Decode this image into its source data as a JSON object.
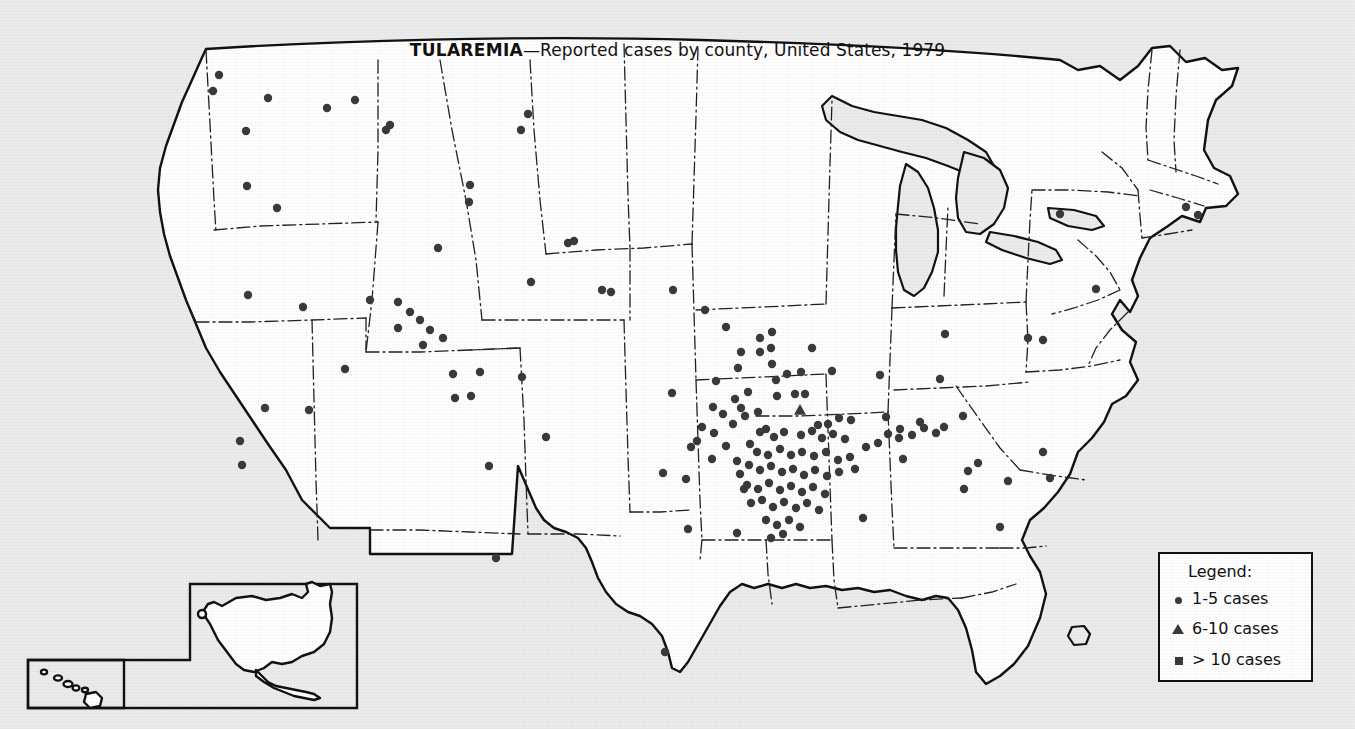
{
  "title": {
    "disease": "TULAREMIA",
    "rest": "—Reported cases by county, United States, 1979",
    "full": "TULAREMIA—Reported cases by county, United States, 1979"
  },
  "legend": {
    "heading": "Legend:",
    "items": [
      {
        "symbol": "circle",
        "label": "1-5 cases"
      },
      {
        "symbol": "triangle",
        "label": "6-10 cases"
      },
      {
        "symbol": "square",
        "label": "> 10 cases"
      }
    ]
  },
  "insets": [
    {
      "name": "alaska-inset",
      "label": ""
    },
    {
      "name": "hawaii-inset",
      "label": ""
    }
  ],
  "colors": {
    "page_background": "#ececec",
    "land_fill": "#ffffff",
    "water_fill": "#ececec",
    "outline": "#111111",
    "state_border": "#222222",
    "marker": "#3a3a3a",
    "legend_background": "#ffffff",
    "legend_border": "#111111"
  },
  "chart_data": {
    "type": "map",
    "title": "TULAREMIA—Reported cases by county, United States, 1979",
    "projection": "contiguous-united-states-with-alaska-hawaii-insets",
    "marker_classes": [
      {
        "symbol": "circle",
        "meaning": "1-5 cases",
        "count_rendered": 170
      },
      {
        "symbol": "triangle",
        "meaning": "6-10 cases",
        "count_rendered": 1
      },
      {
        "symbol": "square",
        "meaning": "> 10 cases",
        "count_rendered": 0
      }
    ],
    "markers": [
      {
        "x": 219,
        "y": 75,
        "s": "c"
      },
      {
        "x": 268,
        "y": 98,
        "s": "c"
      },
      {
        "x": 327,
        "y": 108,
        "s": "c"
      },
      {
        "x": 390,
        "y": 125,
        "s": "c"
      },
      {
        "x": 528,
        "y": 114,
        "s": "c"
      },
      {
        "x": 213,
        "y": 91,
        "s": "c"
      },
      {
        "x": 246,
        "y": 131,
        "s": "c"
      },
      {
        "x": 355,
        "y": 100,
        "s": "c"
      },
      {
        "x": 386,
        "y": 130,
        "s": "c"
      },
      {
        "x": 247,
        "y": 186,
        "s": "c"
      },
      {
        "x": 277,
        "y": 208,
        "s": "c"
      },
      {
        "x": 470,
        "y": 185,
        "s": "c"
      },
      {
        "x": 469,
        "y": 202,
        "s": "c"
      },
      {
        "x": 574,
        "y": 241,
        "s": "c"
      },
      {
        "x": 438,
        "y": 248,
        "s": "c"
      },
      {
        "x": 248,
        "y": 295,
        "s": "c"
      },
      {
        "x": 303,
        "y": 307,
        "s": "c"
      },
      {
        "x": 240,
        "y": 441,
        "s": "c"
      },
      {
        "x": 242,
        "y": 465,
        "s": "c"
      },
      {
        "x": 265,
        "y": 408,
        "s": "c"
      },
      {
        "x": 309,
        "y": 410,
        "s": "c"
      },
      {
        "x": 345,
        "y": 369,
        "s": "c"
      },
      {
        "x": 370,
        "y": 300,
        "s": "c"
      },
      {
        "x": 398,
        "y": 302,
        "s": "c"
      },
      {
        "x": 410,
        "y": 312,
        "s": "c"
      },
      {
        "x": 420,
        "y": 320,
        "s": "c"
      },
      {
        "x": 430,
        "y": 330,
        "s": "c"
      },
      {
        "x": 398,
        "y": 328,
        "s": "c"
      },
      {
        "x": 423,
        "y": 345,
        "s": "c"
      },
      {
        "x": 443,
        "y": 338,
        "s": "c"
      },
      {
        "x": 453,
        "y": 374,
        "s": "c"
      },
      {
        "x": 480,
        "y": 372,
        "s": "c"
      },
      {
        "x": 522,
        "y": 377,
        "s": "c"
      },
      {
        "x": 455,
        "y": 398,
        "s": "c"
      },
      {
        "x": 471,
        "y": 396,
        "s": "c"
      },
      {
        "x": 489,
        "y": 466,
        "s": "c"
      },
      {
        "x": 546,
        "y": 437,
        "s": "c"
      },
      {
        "x": 496,
        "y": 558,
        "s": "c"
      },
      {
        "x": 521,
        "y": 130,
        "s": "c"
      },
      {
        "x": 531,
        "y": 282,
        "s": "c"
      },
      {
        "x": 673,
        "y": 290,
        "s": "c"
      },
      {
        "x": 568,
        "y": 243,
        "s": "c"
      },
      {
        "x": 602,
        "y": 290,
        "s": "c"
      },
      {
        "x": 611,
        "y": 292,
        "s": "c"
      },
      {
        "x": 663,
        "y": 473,
        "s": "c"
      },
      {
        "x": 665,
        "y": 652,
        "s": "c"
      },
      {
        "x": 688,
        "y": 529,
        "s": "c"
      },
      {
        "x": 737,
        "y": 533,
        "s": "c"
      },
      {
        "x": 697,
        "y": 441,
        "s": "c"
      },
      {
        "x": 714,
        "y": 433,
        "s": "c"
      },
      {
        "x": 726,
        "y": 446,
        "s": "c"
      },
      {
        "x": 733,
        "y": 424,
        "s": "c"
      },
      {
        "x": 737,
        "y": 461,
        "s": "c"
      },
      {
        "x": 740,
        "y": 474,
        "s": "c"
      },
      {
        "x": 744,
        "y": 489,
        "s": "c"
      },
      {
        "x": 750,
        "y": 444,
        "s": "c"
      },
      {
        "x": 745,
        "y": 416,
        "s": "c"
      },
      {
        "x": 760,
        "y": 352,
        "s": "c"
      },
      {
        "x": 771,
        "y": 348,
        "s": "c"
      },
      {
        "x": 772,
        "y": 364,
        "s": "c"
      },
      {
        "x": 776,
        "y": 380,
        "s": "c"
      },
      {
        "x": 787,
        "y": 374,
        "s": "c"
      },
      {
        "x": 801,
        "y": 372,
        "s": "c"
      },
      {
        "x": 812,
        "y": 348,
        "s": "c"
      },
      {
        "x": 832,
        "y": 371,
        "s": "c"
      },
      {
        "x": 777,
        "y": 396,
        "s": "c"
      },
      {
        "x": 795,
        "y": 394,
        "s": "c"
      },
      {
        "x": 805,
        "y": 394,
        "s": "c"
      },
      {
        "x": 800,
        "y": 410,
        "s": "t"
      },
      {
        "x": 758,
        "y": 412,
        "s": "c"
      },
      {
        "x": 741,
        "y": 408,
        "s": "c"
      },
      {
        "x": 760,
        "y": 432,
        "s": "c"
      },
      {
        "x": 766,
        "y": 429,
        "s": "c"
      },
      {
        "x": 774,
        "y": 437,
        "s": "c"
      },
      {
        "x": 784,
        "y": 432,
        "s": "c"
      },
      {
        "x": 801,
        "y": 435,
        "s": "c"
      },
      {
        "x": 812,
        "y": 431,
        "s": "c"
      },
      {
        "x": 822,
        "y": 438,
        "s": "c"
      },
      {
        "x": 833,
        "y": 434,
        "s": "c"
      },
      {
        "x": 845,
        "y": 439,
        "s": "c"
      },
      {
        "x": 818,
        "y": 425,
        "s": "c"
      },
      {
        "x": 828,
        "y": 424,
        "s": "c"
      },
      {
        "x": 839,
        "y": 418,
        "s": "c"
      },
      {
        "x": 851,
        "y": 420,
        "s": "c"
      },
      {
        "x": 757,
        "y": 452,
        "s": "c"
      },
      {
        "x": 768,
        "y": 455,
        "s": "c"
      },
      {
        "x": 780,
        "y": 449,
        "s": "c"
      },
      {
        "x": 791,
        "y": 455,
        "s": "c"
      },
      {
        "x": 802,
        "y": 452,
        "s": "c"
      },
      {
        "x": 814,
        "y": 456,
        "s": "c"
      },
      {
        "x": 826,
        "y": 452,
        "s": "c"
      },
      {
        "x": 838,
        "y": 460,
        "s": "c"
      },
      {
        "x": 850,
        "y": 457,
        "s": "c"
      },
      {
        "x": 749,
        "y": 465,
        "s": "c"
      },
      {
        "x": 760,
        "y": 470,
        "s": "c"
      },
      {
        "x": 771,
        "y": 466,
        "s": "c"
      },
      {
        "x": 782,
        "y": 472,
        "s": "c"
      },
      {
        "x": 793,
        "y": 469,
        "s": "c"
      },
      {
        "x": 804,
        "y": 475,
        "s": "c"
      },
      {
        "x": 815,
        "y": 470,
        "s": "c"
      },
      {
        "x": 827,
        "y": 476,
        "s": "c"
      },
      {
        "x": 839,
        "y": 472,
        "s": "c"
      },
      {
        "x": 855,
        "y": 469,
        "s": "c"
      },
      {
        "x": 747,
        "y": 485,
        "s": "c"
      },
      {
        "x": 758,
        "y": 489,
        "s": "c"
      },
      {
        "x": 769,
        "y": 483,
        "s": "c"
      },
      {
        "x": 780,
        "y": 490,
        "s": "c"
      },
      {
        "x": 791,
        "y": 486,
        "s": "c"
      },
      {
        "x": 802,
        "y": 492,
        "s": "c"
      },
      {
        "x": 813,
        "y": 487,
        "s": "c"
      },
      {
        "x": 825,
        "y": 494,
        "s": "c"
      },
      {
        "x": 751,
        "y": 503,
        "s": "c"
      },
      {
        "x": 762,
        "y": 500,
        "s": "c"
      },
      {
        "x": 773,
        "y": 507,
        "s": "c"
      },
      {
        "x": 784,
        "y": 502,
        "s": "c"
      },
      {
        "x": 796,
        "y": 508,
        "s": "c"
      },
      {
        "x": 807,
        "y": 503,
        "s": "c"
      },
      {
        "x": 819,
        "y": 510,
        "s": "c"
      },
      {
        "x": 766,
        "y": 520,
        "s": "c"
      },
      {
        "x": 777,
        "y": 525,
        "s": "c"
      },
      {
        "x": 789,
        "y": 520,
        "s": "c"
      },
      {
        "x": 800,
        "y": 527,
        "s": "c"
      },
      {
        "x": 771,
        "y": 538,
        "s": "c"
      },
      {
        "x": 783,
        "y": 534,
        "s": "c"
      },
      {
        "x": 863,
        "y": 518,
        "s": "c"
      },
      {
        "x": 866,
        "y": 447,
        "s": "c"
      },
      {
        "x": 878,
        "y": 443,
        "s": "c"
      },
      {
        "x": 888,
        "y": 434,
        "s": "c"
      },
      {
        "x": 900,
        "y": 429,
        "s": "c"
      },
      {
        "x": 912,
        "y": 435,
        "s": "c"
      },
      {
        "x": 924,
        "y": 428,
        "s": "c"
      },
      {
        "x": 936,
        "y": 433,
        "s": "c"
      },
      {
        "x": 944,
        "y": 427,
        "s": "c"
      },
      {
        "x": 968,
        "y": 471,
        "s": "c"
      },
      {
        "x": 978,
        "y": 463,
        "s": "c"
      },
      {
        "x": 964,
        "y": 489,
        "s": "c"
      },
      {
        "x": 1008,
        "y": 481,
        "s": "c"
      },
      {
        "x": 1043,
        "y": 452,
        "s": "c"
      },
      {
        "x": 1050,
        "y": 478,
        "s": "c"
      },
      {
        "x": 1028,
        "y": 338,
        "s": "c"
      },
      {
        "x": 1060,
        "y": 214,
        "s": "c"
      },
      {
        "x": 1186,
        "y": 207,
        "s": "c"
      },
      {
        "x": 1198,
        "y": 215,
        "s": "c"
      },
      {
        "x": 1096,
        "y": 289,
        "s": "c"
      },
      {
        "x": 945,
        "y": 334,
        "s": "c"
      },
      {
        "x": 880,
        "y": 375,
        "s": "c"
      },
      {
        "x": 940,
        "y": 379,
        "s": "c"
      },
      {
        "x": 1043,
        "y": 340,
        "s": "c"
      },
      {
        "x": 963,
        "y": 416,
        "s": "c"
      },
      {
        "x": 920,
        "y": 422,
        "s": "c"
      },
      {
        "x": 886,
        "y": 417,
        "s": "c"
      },
      {
        "x": 903,
        "y": 459,
        "s": "c"
      },
      {
        "x": 899,
        "y": 438,
        "s": "c"
      },
      {
        "x": 1000,
        "y": 527,
        "s": "c"
      },
      {
        "x": 716,
        "y": 381,
        "s": "c"
      },
      {
        "x": 738,
        "y": 368,
        "s": "c"
      },
      {
        "x": 672,
        "y": 393,
        "s": "c"
      },
      {
        "x": 712,
        "y": 459,
        "s": "c"
      },
      {
        "x": 686,
        "y": 479,
        "s": "c"
      },
      {
        "x": 741,
        "y": 352,
        "s": "c"
      },
      {
        "x": 760,
        "y": 338,
        "s": "c"
      },
      {
        "x": 772,
        "y": 332,
        "s": "c"
      },
      {
        "x": 705,
        "y": 310,
        "s": "c"
      },
      {
        "x": 726,
        "y": 327,
        "s": "c"
      },
      {
        "x": 748,
        "y": 392,
        "s": "c"
      },
      {
        "x": 713,
        "y": 407,
        "s": "c"
      },
      {
        "x": 723,
        "y": 414,
        "s": "c"
      },
      {
        "x": 735,
        "y": 399,
        "s": "c"
      },
      {
        "x": 702,
        "y": 427,
        "s": "c"
      },
      {
        "x": 691,
        "y": 447,
        "s": "c"
      }
    ]
  }
}
